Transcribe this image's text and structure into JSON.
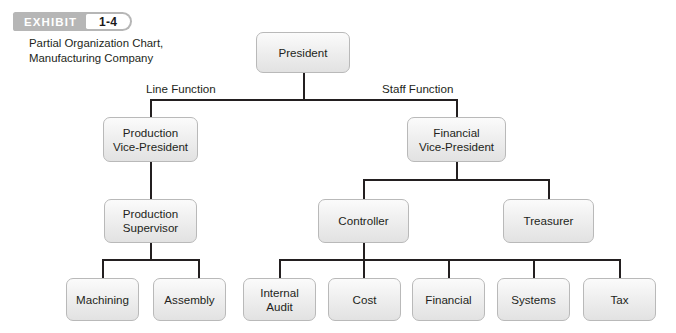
{
  "exhibit": {
    "label": "EXHIBIT",
    "number": "1-4",
    "badge_bg": "#b6b6b6",
    "badge_text_color": "#ffffff"
  },
  "caption": "Partial Organization Chart, Manufacturing Company",
  "chart": {
    "type": "org-chart",
    "box_fill": "#f0f0f0",
    "box_border": "#b9b9b9",
    "connector_color": "#231f20",
    "branch_labels": [
      {
        "id": "line-function",
        "text": "Line Function"
      },
      {
        "id": "staff-function",
        "text": "Staff Function"
      }
    ],
    "nodes": [
      {
        "id": "president",
        "label": "President",
        "level": 1
      },
      {
        "id": "production-vice-president",
        "label": "Production Vice-President",
        "line1": "Production",
        "line2": "Vice-President",
        "level": 2,
        "branch": "line"
      },
      {
        "id": "financial-vice-president",
        "label": "Financial Vice-President",
        "line1": "Financial",
        "line2": "Vice-President",
        "level": 2,
        "branch": "staff"
      },
      {
        "id": "production-supervisor",
        "label": "Production Supervisor",
        "line1": "Production",
        "line2": "Supervisor",
        "level": 3,
        "branch": "line"
      },
      {
        "id": "controller",
        "label": "Controller",
        "level": 3,
        "branch": "staff"
      },
      {
        "id": "treasurer",
        "label": "Treasurer",
        "level": 3,
        "branch": "staff"
      },
      {
        "id": "machining",
        "label": "Machining",
        "level": 4,
        "branch": "line"
      },
      {
        "id": "assembly",
        "label": "Assembly",
        "level": 4,
        "branch": "line"
      },
      {
        "id": "internal-audit",
        "label": "Internal Audit",
        "line1": "Internal",
        "line2": "Audit",
        "level": 4,
        "branch": "staff"
      },
      {
        "id": "cost",
        "label": "Cost",
        "level": 4,
        "branch": "staff"
      },
      {
        "id": "financial",
        "label": "Financial",
        "level": 4,
        "branch": "staff"
      },
      {
        "id": "systems",
        "label": "Systems",
        "level": 4,
        "branch": "staff"
      },
      {
        "id": "tax",
        "label": "Tax",
        "level": 4,
        "branch": "staff"
      }
    ],
    "edges": [
      {
        "from": "president",
        "to": "production-vice-president"
      },
      {
        "from": "president",
        "to": "financial-vice-president"
      },
      {
        "from": "production-vice-president",
        "to": "production-supervisor"
      },
      {
        "from": "financial-vice-president",
        "to": "controller"
      },
      {
        "from": "financial-vice-president",
        "to": "treasurer"
      },
      {
        "from": "production-supervisor",
        "to": "machining"
      },
      {
        "from": "production-supervisor",
        "to": "assembly"
      },
      {
        "from": "controller",
        "to": "internal-audit"
      },
      {
        "from": "controller",
        "to": "cost"
      },
      {
        "from": "controller",
        "to": "financial"
      },
      {
        "from": "controller",
        "to": "systems"
      },
      {
        "from": "controller",
        "to": "tax"
      }
    ]
  }
}
